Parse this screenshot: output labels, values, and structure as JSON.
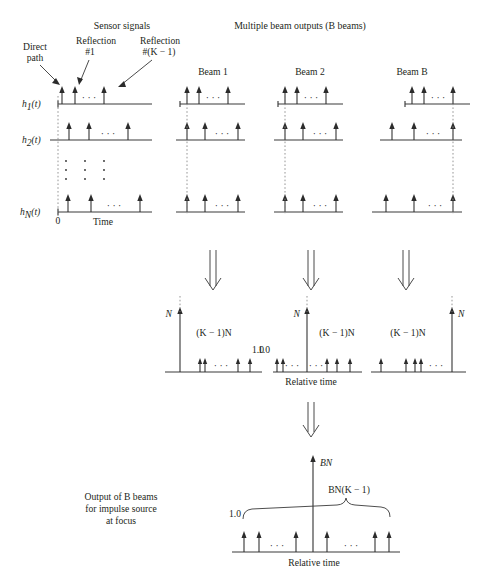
{
  "figure": {
    "title_left": "Sensor signals",
    "title_right": "Multiple beam outputs (B beams)",
    "annotations": {
      "direct_path_line1": "Direct",
      "direct_path_line2": "path",
      "reflection1_line1": "Reflection",
      "reflection1_line2": "#1",
      "reflectionK_line1": "Reflection",
      "reflectionK_line2": "#(K − 1)"
    },
    "sensor_rows": [
      {
        "label": "h",
        "sub": "1",
        "suffix": "(t)"
      },
      {
        "label": "h",
        "sub": "2",
        "suffix": "(t)"
      },
      {
        "label": "h",
        "sub": "N",
        "suffix": "(t)"
      }
    ],
    "sensor_axis": {
      "origin_label": "0",
      "time_label": "Time"
    },
    "beams": [
      {
        "name": "Beam 1",
        "spike_label": "N",
        "area_label": "(K − 1)N",
        "unit_label": "1.0"
      },
      {
        "name": "Beam 2",
        "spike_label": "N",
        "area_label": "(K − 1)N",
        "unit_label": "1.0"
      },
      {
        "name": "Beam B",
        "spike_label": "N",
        "area_label": "(K − 1)N",
        "unit_label": "1.0"
      }
    ],
    "beam_axis_label": "Relative time",
    "summary": {
      "caption_line1": "Output of B beams",
      "caption_line2": "for impulse source",
      "caption_line3": "at focus",
      "peak_label": "BN",
      "brace_label": "BN(K − 1)",
      "unit_label": "1.0",
      "axis_label": "Relative time"
    },
    "ellipsis": "· · ·",
    "arrow_glyph": "down-double-arrow",
    "colors": {
      "ink": "#231f20",
      "line": "#3a3a3a",
      "dashed": "#8a8a8a",
      "background": "#ffffff"
    }
  }
}
